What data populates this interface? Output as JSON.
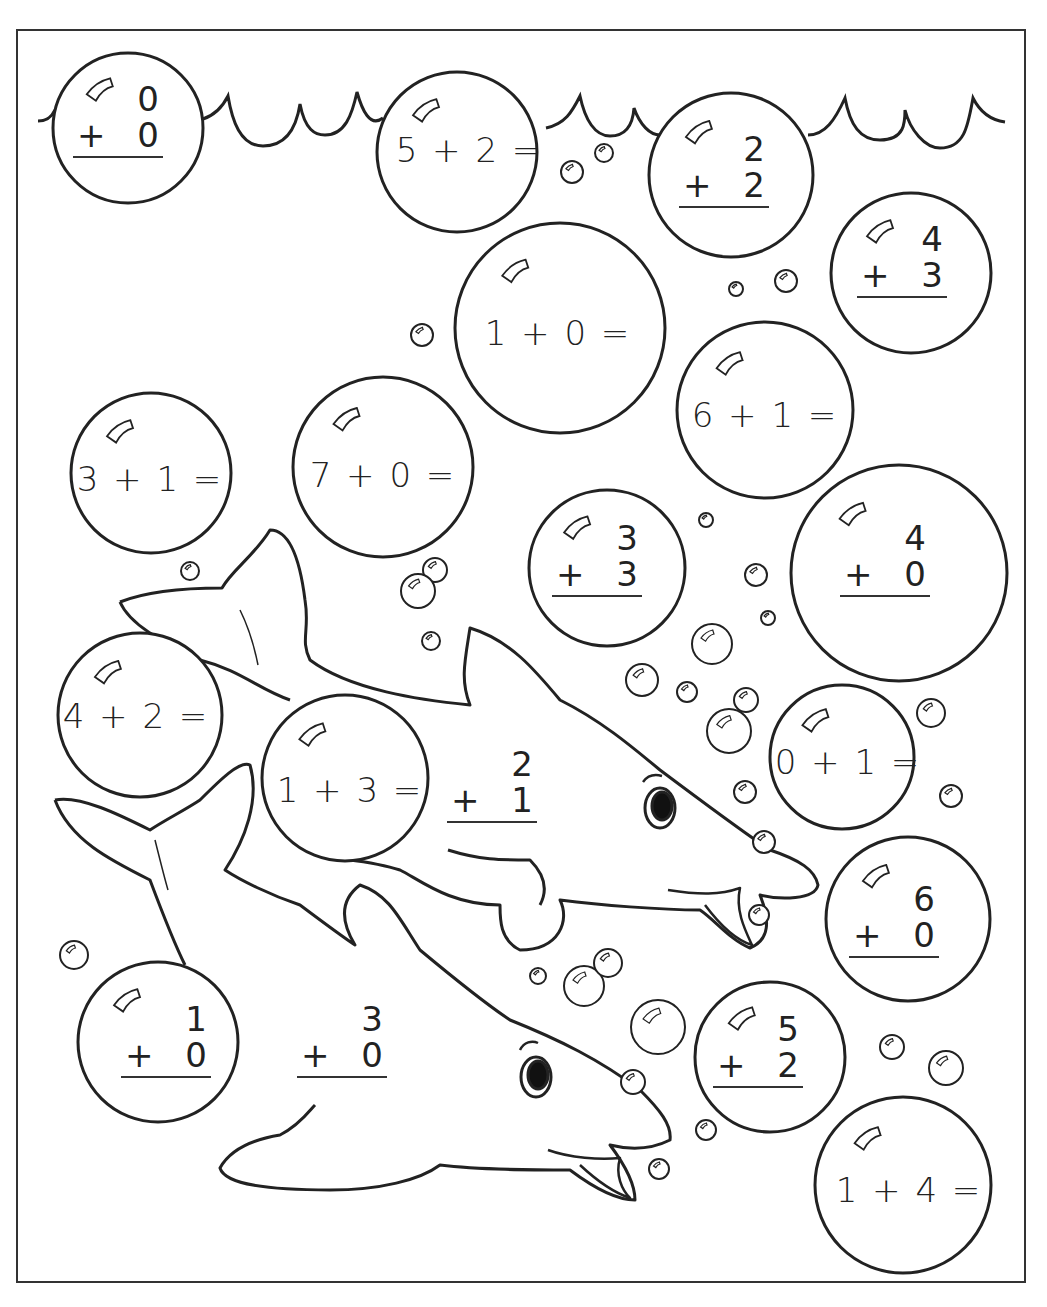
{
  "worksheet": {
    "theme": "dolphins-under-the-sea",
    "colors": {
      "ink": "#222222",
      "paper": "#ffffff"
    },
    "horizontal_problems": [
      {
        "id": "h1",
        "text": "5 + 2 =",
        "x": 469,
        "y": 150
      },
      {
        "id": "h2",
        "text": "1 + 0 =",
        "x": 558,
        "y": 333
      },
      {
        "id": "h3",
        "text": "6 + 1 =",
        "x": 765,
        "y": 415
      },
      {
        "id": "h4",
        "text": "3 + 1 =",
        "x": 150,
        "y": 479
      },
      {
        "id": "h5",
        "text": "7 + 0 =",
        "x": 383,
        "y": 475
      },
      {
        "id": "h6",
        "text": "4 + 2 =",
        "x": 136,
        "y": 716
      },
      {
        "id": "h7",
        "text": "1 + 3 =",
        "x": 350,
        "y": 790
      },
      {
        "id": "h8",
        "text": "0 + 1 =",
        "x": 848,
        "y": 762
      },
      {
        "id": "h9",
        "text": "1 + 4 =",
        "x": 909,
        "y": 1190
      }
    ],
    "vertical_problems": [
      {
        "id": "v1",
        "top": "0",
        "op": "+",
        "bottom": "0",
        "x": 118,
        "y": 120
      },
      {
        "id": "v2",
        "top": "2",
        "op": "+",
        "bottom": "2",
        "x": 724,
        "y": 170
      },
      {
        "id": "v3",
        "top": "4",
        "op": "+",
        "bottom": "3",
        "x": 902,
        "y": 260
      },
      {
        "id": "v4",
        "top": "3",
        "op": "+",
        "bottom": "3",
        "x": 597,
        "y": 559
      },
      {
        "id": "v5",
        "top": "4",
        "op": "+",
        "bottom": "0",
        "x": 885,
        "y": 559
      },
      {
        "id": "v6",
        "top": "2",
        "op": "+",
        "bottom": "1",
        "x": 492,
        "y": 785
      },
      {
        "id": "v7",
        "top": "6",
        "op": "+",
        "bottom": "0",
        "x": 894,
        "y": 920
      },
      {
        "id": "v8",
        "top": "1",
        "op": "+",
        "bottom": "0",
        "x": 166,
        "y": 1040
      },
      {
        "id": "v9",
        "top": "3",
        "op": "+",
        "bottom": "0",
        "x": 342,
        "y": 1040
      },
      {
        "id": "v10",
        "top": "5",
        "op": "+",
        "bottom": "2",
        "x": 758,
        "y": 1050
      }
    ],
    "big_bubbles": [
      {
        "cx": 128,
        "cy": 128,
        "r": 75
      },
      {
        "cx": 457,
        "cy": 152,
        "r": 80
      },
      {
        "cx": 731,
        "cy": 175,
        "r": 82
      },
      {
        "cx": 911,
        "cy": 273,
        "r": 80
      },
      {
        "cx": 560,
        "cy": 328,
        "r": 105
      },
      {
        "cx": 765,
        "cy": 410,
        "r": 88
      },
      {
        "cx": 151,
        "cy": 473,
        "r": 80
      },
      {
        "cx": 383,
        "cy": 467,
        "r": 90
      },
      {
        "cx": 607,
        "cy": 568,
        "r": 78
      },
      {
        "cx": 899,
        "cy": 573,
        "r": 108
      },
      {
        "cx": 140,
        "cy": 715,
        "r": 82
      },
      {
        "cx": 345,
        "cy": 778,
        "r": 83
      },
      {
        "cx": 842,
        "cy": 757,
        "r": 72
      },
      {
        "cx": 908,
        "cy": 919,
        "r": 82
      },
      {
        "cx": 158,
        "cy": 1042,
        "r": 80
      },
      {
        "cx": 770,
        "cy": 1057,
        "r": 75
      },
      {
        "cx": 903,
        "cy": 1185,
        "r": 88
      }
    ],
    "small_bubbles": [
      {
        "cx": 572,
        "cy": 172,
        "r": 11
      },
      {
        "cx": 604,
        "cy": 153,
        "r": 9
      },
      {
        "cx": 736,
        "cy": 289,
        "r": 7
      },
      {
        "cx": 786,
        "cy": 281,
        "r": 11
      },
      {
        "cx": 422,
        "cy": 335,
        "r": 11
      },
      {
        "cx": 190,
        "cy": 571,
        "r": 9
      },
      {
        "cx": 435,
        "cy": 570,
        "r": 12
      },
      {
        "cx": 418,
        "cy": 591,
        "r": 17
      },
      {
        "cx": 431,
        "cy": 641,
        "r": 9
      },
      {
        "cx": 706,
        "cy": 520,
        "r": 7
      },
      {
        "cx": 756,
        "cy": 575,
        "r": 11
      },
      {
        "cx": 768,
        "cy": 618,
        "r": 7
      },
      {
        "cx": 712,
        "cy": 644,
        "r": 20
      },
      {
        "cx": 642,
        "cy": 680,
        "r": 16
      },
      {
        "cx": 687,
        "cy": 692,
        "r": 10
      },
      {
        "cx": 746,
        "cy": 700,
        "r": 12
      },
      {
        "cx": 729,
        "cy": 731,
        "r": 22
      },
      {
        "cx": 745,
        "cy": 792,
        "r": 11
      },
      {
        "cx": 764,
        "cy": 842,
        "r": 11
      },
      {
        "cx": 931,
        "cy": 713,
        "r": 14
      },
      {
        "cx": 951,
        "cy": 796,
        "r": 11
      },
      {
        "cx": 759,
        "cy": 915,
        "r": 10
      },
      {
        "cx": 74,
        "cy": 955,
        "r": 14
      },
      {
        "cx": 538,
        "cy": 976,
        "r": 8
      },
      {
        "cx": 584,
        "cy": 986,
        "r": 20
      },
      {
        "cx": 608,
        "cy": 963,
        "r": 14
      },
      {
        "cx": 658,
        "cy": 1027,
        "r": 27
      },
      {
        "cx": 633,
        "cy": 1082,
        "r": 12
      },
      {
        "cx": 706,
        "cy": 1130,
        "r": 10
      },
      {
        "cx": 659,
        "cy": 1169,
        "r": 10
      },
      {
        "cx": 892,
        "cy": 1047,
        "r": 12
      },
      {
        "cx": 946,
        "cy": 1068,
        "r": 17
      }
    ]
  }
}
